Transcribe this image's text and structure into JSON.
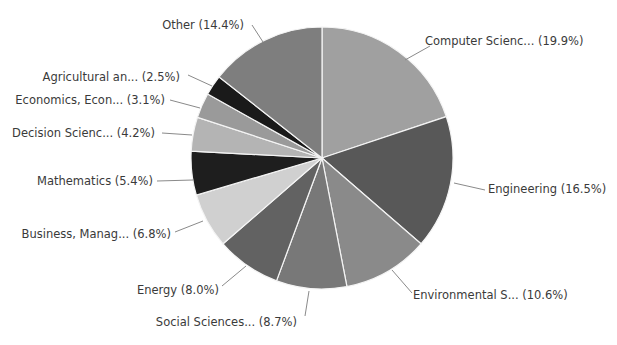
{
  "chart_data": {
    "type": "pie",
    "title": "",
    "start_angle": "12 o'clock",
    "direction": "clockwise",
    "legend": "none (outside labels with leader lines)",
    "categories": [
      "Computer Scienc...",
      "Engineering",
      "Environmental S...",
      "Social Sciences...",
      "Energy",
      "Business, Manag...",
      "Mathematics",
      "Decision Scienc...",
      "Economics, Econ...",
      "Agricultural an...",
      "Other"
    ],
    "values": [
      19.9,
      16.5,
      10.6,
      8.7,
      8.0,
      6.8,
      5.4,
      4.2,
      3.1,
      2.5,
      14.4
    ],
    "labels": [
      "Computer Scienc... (19.9%)",
      "Engineering (16.5%)",
      "Environmental S... (10.6%)",
      "Social Sciences... (8.7%)",
      "Energy (8.0%)",
      "Business, Manag... (6.8%)",
      "Mathematics (5.4%)",
      "Decision Scienc... (4.2%)",
      "Economics, Econ... (3.1%)",
      "Agricultural an... (2.5%)",
      "Other (14.4%)"
    ],
    "colors": [
      "#a0a0a0",
      "#585858",
      "#8a8a8a",
      "#787878",
      "#626262",
      "#d0d0d0",
      "#1e1e1e",
      "#b4b4b4",
      "#9a9a9a",
      "#1a1a1a",
      "#7e7e7e"
    ],
    "unit": "%"
  }
}
